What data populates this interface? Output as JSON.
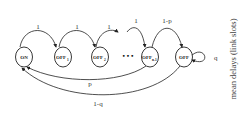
{
  "diagram": {
    "type": "markov-chain",
    "nodes": [
      {
        "id": "on",
        "label": "ON",
        "sub": ""
      },
      {
        "id": "off1",
        "label": "OFF",
        "sub": "1"
      },
      {
        "id": "off2",
        "label": "OFF",
        "sub": "2"
      },
      {
        "id": "offn1",
        "label": "OFF",
        "sub": "n-1"
      },
      {
        "id": "off",
        "label": "OFF",
        "sub": ""
      }
    ],
    "ellipsis": "• • •",
    "edges": [
      {
        "from": "on",
        "to": "off1",
        "label": "1"
      },
      {
        "from": "off1",
        "to": "off2",
        "label": "1"
      },
      {
        "from": "off2",
        "to": "ellipsis",
        "label": "1"
      },
      {
        "from": "ellipsis",
        "to": "offn1",
        "label": "1"
      },
      {
        "from": "offn1",
        "to": "off",
        "label": "1-p"
      },
      {
        "from": "off",
        "to": "off",
        "label": "q"
      },
      {
        "from": "offn1",
        "to": "on",
        "label": "p"
      },
      {
        "from": "off",
        "to": "on",
        "label": "1-q"
      }
    ]
  },
  "side_label": "mean delays (link slots)"
}
